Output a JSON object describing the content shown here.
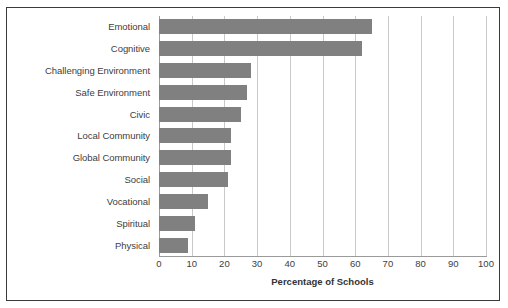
{
  "chart_data": {
    "type": "bar",
    "orientation": "horizontal",
    "title": "",
    "xlabel": "Percentage of Schools",
    "ylabel": "",
    "xlim": [
      0,
      100
    ],
    "xticks": [
      0,
      10,
      20,
      30,
      40,
      50,
      60,
      70,
      80,
      90,
      100
    ],
    "grid": true,
    "legend": false,
    "bar_color": "#808080",
    "categories": [
      "Emotional",
      "Cognitive",
      "Challenging Environment",
      "Safe Environment",
      "Civic",
      "Local Community",
      "Global Community",
      "Social",
      "Vocational",
      "Spiritual",
      "Physical"
    ],
    "values": [
      65,
      62,
      28,
      27,
      25,
      22,
      22,
      21,
      15,
      11,
      9
    ]
  },
  "axis": {
    "x_title": "Percentage of Schools"
  }
}
